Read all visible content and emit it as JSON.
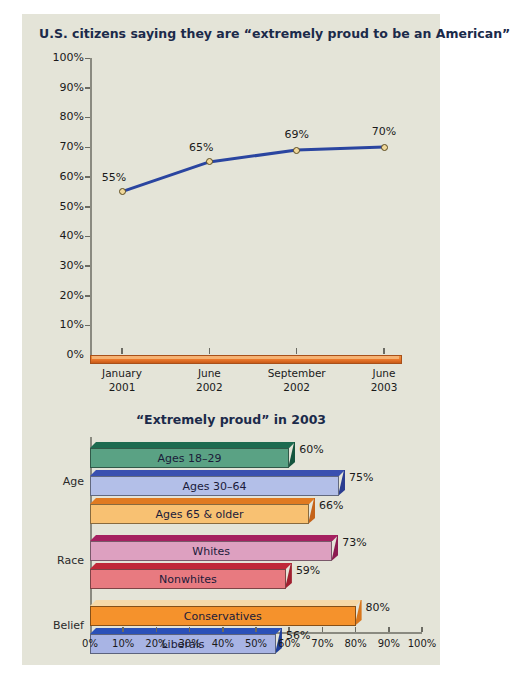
{
  "chart_data": [
    {
      "type": "line",
      "title": "U.S. citizens saying they are “extremely proud to be an American”",
      "xlabel": "",
      "ylabel": "",
      "ylim": [
        0,
        100
      ],
      "grid": false,
      "categories": [
        "January\n2001",
        "June\n2002",
        "September\n2002",
        "June\n2003"
      ],
      "x_tick_labels": [
        {
          "line1": "January",
          "line2": "2001"
        },
        {
          "line1": "June",
          "line2": "2002"
        },
        {
          "line1": "September",
          "line2": "2002"
        },
        {
          "line1": "June",
          "line2": "2003"
        }
      ],
      "y_tick_labels": [
        "100%",
        "90%",
        "80%",
        "70%",
        "60%",
        "50%",
        "40%",
        "30%",
        "20%",
        "10%",
        "0%"
      ],
      "y_ticks": [
        100,
        90,
        80,
        70,
        60,
        50,
        40,
        30,
        20,
        10,
        0
      ],
      "values": [
        55,
        65,
        69,
        70
      ],
      "point_labels": [
        "55%",
        "65%",
        "69%",
        "70%"
      ],
      "line_color": "#2a45a0",
      "marker_color": "#efd79a",
      "baseline_color": "#e8752a"
    },
    {
      "type": "bar",
      "orientation": "horizontal",
      "title": "“Extremely proud” in 2003",
      "xlabel": "",
      "ylabel": "",
      "xlim": [
        0,
        100
      ],
      "grid": false,
      "x_tick_labels": [
        "0%",
        "10%",
        "20%",
        "30%",
        "40%",
        "50%",
        "60%",
        "70%",
        "80%",
        "90%",
        "100%"
      ],
      "x_ticks": [
        0,
        10,
        20,
        30,
        40,
        50,
        60,
        70,
        80,
        90,
        100
      ],
      "groups": [
        {
          "name": "Age",
          "bars": [
            {
              "label": "Ages 18–29",
              "value": 60,
              "value_label": "60%",
              "color": "#5aa284",
              "top_color": "#1d6b50",
              "side_color": "#14543d"
            },
            {
              "label": "Ages 30–64",
              "value": 75,
              "value_label": "75%",
              "color": "#b3bfe8",
              "top_color": "#3a50b0",
              "side_color": "#2b3d90"
            },
            {
              "label": "Ages 65 & older",
              "value": 66,
              "value_label": "66%",
              "color": "#f8c172",
              "top_color": "#e07a20",
              "side_color": "#c4631a"
            }
          ]
        },
        {
          "name": "Race",
          "bars": [
            {
              "label": "Whites",
              "value": 73,
              "value_label": "73%",
              "color": "#dda0c0",
              "top_color": "#a52060",
              "side_color": "#8c1a50"
            },
            {
              "label": "Nonwhites",
              "value": 59,
              "value_label": "59%",
              "color": "#e87a80",
              "top_color": "#c02838",
              "side_color": "#a02030"
            }
          ]
        },
        {
          "name": "Belief",
          "bars": [
            {
              "label": "Conservatives",
              "value": 80,
              "value_label": "80%",
              "color": "#f5922c",
              "top_color": "#f7d9a8",
              "side_color": "#d8761c"
            },
            {
              "label": "Liberals",
              "value": 56,
              "value_label": "56%",
              "color": "#a8b4e4",
              "top_color": "#2a50b8",
              "side_color": "#1f3e98"
            }
          ]
        }
      ]
    }
  ],
  "colors": {
    "panel_background": "#e4e4d8",
    "title_text": "#1b2a4a",
    "axis": "#8a8a80"
  }
}
